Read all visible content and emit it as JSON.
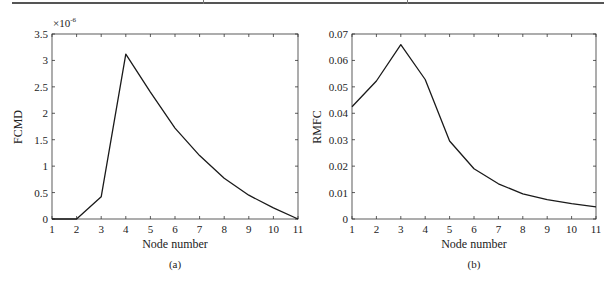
{
  "chart_data": [
    {
      "type": "line",
      "panel": "a",
      "caption": "(a)",
      "title": "",
      "xlabel": "Node number",
      "ylabel": "FCMD",
      "y_multiplier_label": "×10",
      "y_multiplier_exponent": "-6",
      "x": [
        1,
        2,
        3,
        4,
        5,
        6,
        7,
        8,
        9,
        10,
        11
      ],
      "values": [
        0,
        0,
        0.42,
        3.12,
        2.4,
        1.72,
        1.2,
        0.77,
        0.45,
        0.21,
        0
      ],
      "xlim": [
        1,
        11
      ],
      "ylim": [
        0,
        3.5
      ],
      "x_ticks": [
        "1",
        "2",
        "3",
        "4",
        "5",
        "6",
        "7",
        "8",
        "9",
        "10",
        "11"
      ],
      "y_ticks": [
        "0",
        "0.5",
        "1",
        "1.5",
        "2",
        "2.5",
        "3",
        "3.5"
      ],
      "grid": false,
      "legend": null
    },
    {
      "type": "line",
      "panel": "b",
      "caption": "(b)",
      "title": "",
      "xlabel": "Node number",
      "ylabel": "RMFC",
      "x": [
        1,
        2,
        3,
        4,
        5,
        6,
        7,
        8,
        9,
        10,
        11
      ],
      "values": [
        0.0425,
        0.0522,
        0.066,
        0.0528,
        0.0295,
        0.019,
        0.0133,
        0.0095,
        0.0073,
        0.0058,
        0.0046
      ],
      "xlim": [
        1,
        11
      ],
      "ylim": [
        0,
        0.07
      ],
      "x_ticks": [
        "1",
        "2",
        "3",
        "4",
        "5",
        "6",
        "7",
        "8",
        "9",
        "10",
        "11"
      ],
      "y_ticks": [
        "0",
        "0.01",
        "0.02",
        "0.03",
        "0.04",
        "0.05",
        "0.06",
        "0.07"
      ],
      "grid": false,
      "legend": null
    }
  ],
  "style": {
    "line_color": "#1a1a1a",
    "axis_color": "#333333"
  }
}
